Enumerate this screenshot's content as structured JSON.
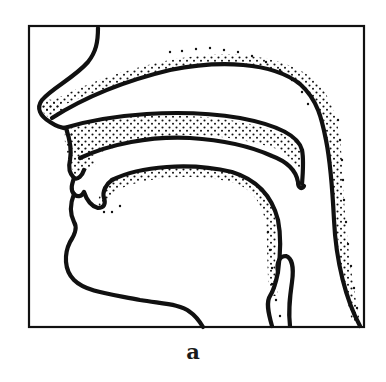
{
  "figure": {
    "caption": "a",
    "colors": {
      "ink": "#111111",
      "background": "#ffffff"
    },
    "frame": {
      "x": 29,
      "y": 26,
      "width": 335,
      "height": 301
    },
    "parts": [
      {
        "id": "nose-outline",
        "label": "nose / face profile"
      },
      {
        "id": "nasal-cavity-roof",
        "label": "nasal cavity upper wall"
      },
      {
        "id": "palate-upper",
        "label": "hard/soft palate upper surface"
      },
      {
        "id": "palate-lower",
        "label": "palate lower surface with velum"
      },
      {
        "id": "tongue",
        "label": "tongue surface"
      },
      {
        "id": "pharyngeal-wall",
        "label": "posterior pharyngeal wall"
      },
      {
        "id": "epiglottis",
        "label": "epiglottis"
      },
      {
        "id": "chin-neck",
        "label": "chin and neck outline"
      }
    ]
  }
}
